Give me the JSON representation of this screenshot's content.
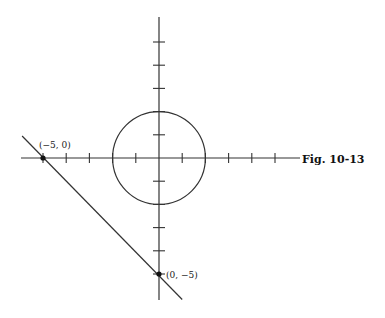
{
  "figure": {
    "caption": "Fig. 10-13",
    "origin_px": [
      159,
      158
    ],
    "unit_px": 23.2,
    "x_axis": {
      "min": -6,
      "max": 6,
      "ticks": [
        -5,
        -4,
        -3,
        -2,
        -1,
        1,
        2,
        3,
        4,
        5
      ]
    },
    "y_axis": {
      "min": -6,
      "max": 6,
      "ticks": [
        -5,
        -4,
        -3,
        -2,
        -1,
        1,
        2,
        3,
        4,
        5
      ]
    },
    "circle": {
      "center": [
        0,
        0
      ],
      "radius": 2
    },
    "line": {
      "equation": "x + y = -5",
      "from": [
        -5.9,
        0.95
      ],
      "to": [
        1.0,
        -6.1
      ]
    },
    "points": [
      {
        "label": "(−5, 0)",
        "x": -5,
        "y": 0
      },
      {
        "label": "(0, −5)",
        "x": 0,
        "y": -5
      }
    ],
    "colors": {
      "stroke": "#333333",
      "background": "#ffffff"
    }
  }
}
